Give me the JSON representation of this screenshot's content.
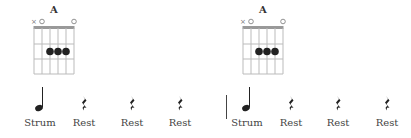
{
  "measures": [
    {
      "chord": {
        "name": "A",
        "string_markers": [
          "x",
          "o",
          "",
          "",
          "",
          "o"
        ],
        "dots": [
          {
            "string": 3,
            "fret": 2
          },
          {
            "string": 4,
            "fret": 2
          },
          {
            "string": 5,
            "fret": 2
          }
        ]
      },
      "beats": [
        {
          "symbol": "half-note",
          "label": "Strum"
        },
        {
          "symbol": "quarter-rest",
          "label": "Rest"
        },
        {
          "symbol": "quarter-rest",
          "label": "Rest"
        },
        {
          "symbol": "quarter-rest",
          "label": "Rest"
        }
      ]
    },
    {
      "chord": {
        "name": "A",
        "string_markers": [
          "x",
          "o",
          "",
          "",
          "",
          "o"
        ],
        "dots": [
          {
            "string": 3,
            "fret": 2
          },
          {
            "string": 4,
            "fret": 2
          },
          {
            "string": 5,
            "fret": 2
          }
        ]
      },
      "beats": [
        {
          "symbol": "half-note",
          "label": "Strum"
        },
        {
          "symbol": "quarter-rest",
          "label": "Rest"
        },
        {
          "symbol": "quarter-rest",
          "label": "Rest"
        },
        {
          "symbol": "quarter-rest",
          "label": "Rest"
        }
      ]
    }
  ],
  "colors": {
    "ink": "#222222",
    "grid": "#bbbbbb",
    "nut": "#999999"
  }
}
